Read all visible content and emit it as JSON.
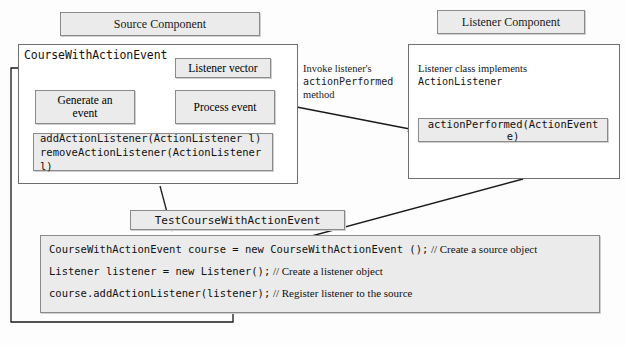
{
  "diagram": {
    "headers": {
      "source_component": "Source Component",
      "listener_component": "Listener Component"
    },
    "source": {
      "class_label": "CourseWithActionEvent",
      "listener_vector": "Listener vector",
      "generate_event_line1": "Generate an",
      "generate_event_line2": "event",
      "process_event": "Process event",
      "methods_line1": "addActionListener(ActionListener l)",
      "methods_line2": "removeActionListener(ActionListener l)"
    },
    "middle_note": {
      "line1": "Invoke listener's",
      "line2_mono": "actionPerformed",
      "line3": "method"
    },
    "listener": {
      "implements_line1": "Listener class implements",
      "implements_line2_mono": "ActionListener",
      "method_box": "actionPerformed(ActionEvent e)"
    },
    "test": {
      "caption": "TestCourseWithActionEvent",
      "lines": [
        {
          "code": "CourseWithActionEvent course = new CourseWithActionEvent ();",
          "comment": "// Create a source object"
        },
        {
          "code": "Listener listener = new Listener();",
          "comment": "// Create a listener object"
        },
        {
          "code": "course.addActionListener(listener);",
          "comment": "// Register listener to the source"
        }
      ]
    },
    "colors": {
      "box_fill": "#ebebeb",
      "box_stroke": "#8a8a8a",
      "outer_stroke": "#6f6f6f",
      "line": "#1a1a1a",
      "page_bg": "#fdfdfd"
    }
  }
}
